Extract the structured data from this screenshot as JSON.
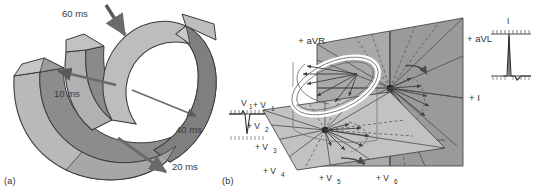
{
  "figure": {
    "panels": [
      {
        "id": "a",
        "caption": "(a)",
        "title": "Ventricular activation isochrones"
      },
      {
        "id": "b",
        "caption": "(b)",
        "title": "ECG lead axes and QRS vector loop"
      }
    ]
  },
  "panel_a": {
    "caption": "(a)",
    "isochrones": [
      {
        "label": "60 ms",
        "value": 60,
        "unit": "ms",
        "x": 62,
        "y": 16,
        "arrow": {
          "x1": 108,
          "y1": 6,
          "x2": 126,
          "y2": 36
        }
      },
      {
        "label": "10 ms",
        "value": 10,
        "unit": "ms",
        "x": 56,
        "y": 93,
        "arrow": {
          "x1": 112,
          "y1": 83,
          "x2": 60,
          "y2": 72
        }
      },
      {
        "label": "40 ms",
        "value": 40,
        "unit": "ms",
        "x": 176,
        "y": 132,
        "arrow": {
          "x1": 135,
          "y1": 92,
          "x2": 197,
          "y2": 117
        }
      },
      {
        "label": "20 ms",
        "value": 20,
        "unit": "ms",
        "x": 172,
        "y": 167,
        "arrow": {
          "x1": 120,
          "y1": 140,
          "x2": 168,
          "y2": 172
        }
      }
    ],
    "colors": {
      "epicardium_light": "#b9b9b9",
      "endocardium_dark": "#8c8c8c",
      "outline": "#3a3a3a",
      "arrow": "#5a5a5a"
    }
  },
  "panel_b": {
    "caption": "(b)",
    "frontal_plane": {
      "name": "frontal-plane",
      "leads": [
        {
          "label": "+ aVR",
          "x": 84,
          "y": 40
        },
        {
          "label": "+ aVL",
          "x": 224,
          "y": 39
        },
        {
          "label": "+ I",
          "x": 228,
          "y": 98
        }
      ]
    },
    "horizontal_plane": {
      "name": "horizontal-plane",
      "leads": [
        {
          "label": "+ V",
          "sub": "1",
          "x": 20,
          "y": 104
        },
        {
          "label": "+ V",
          "sub": "2",
          "x": 13,
          "y": 125
        },
        {
          "label": "+ V",
          "sub": "3",
          "x": 20,
          "y": 145
        },
        {
          "label": "+ V",
          "sub": "4",
          "x": 29,
          "y": 170
        },
        {
          "label": "+ V",
          "sub": "5",
          "x": 84,
          "y": 176
        },
        {
          "label": "+ V",
          "sub": "6",
          "x": 141,
          "y": 176
        }
      ]
    },
    "ecg_traces": [
      {
        "name": "lead-V1-trace",
        "label": "V",
        "sub": "1",
        "morphology": "rS / QS complex — small initial positive then deep negative deflection",
        "x": 0,
        "y": 104
      },
      {
        "name": "lead-I-trace",
        "label": "I",
        "sub": "",
        "morphology": "qRs complex — tall positive R wave",
        "x": 246,
        "y": 42
      }
    ],
    "vector_loop": {
      "name": "qrs-vector-loop",
      "description": "White three-dimensional QRS vector loop",
      "color": "#ffffff"
    },
    "colors": {
      "plane_dark": "#a0a0a0",
      "plane_mid": "#b0b0b0",
      "plane_light": "#c8c8c8",
      "axis_line": "#4a4a4a",
      "dashed_line": "#555555",
      "loop_white": "#ffffff",
      "loop_outline": "#666666"
    }
  }
}
